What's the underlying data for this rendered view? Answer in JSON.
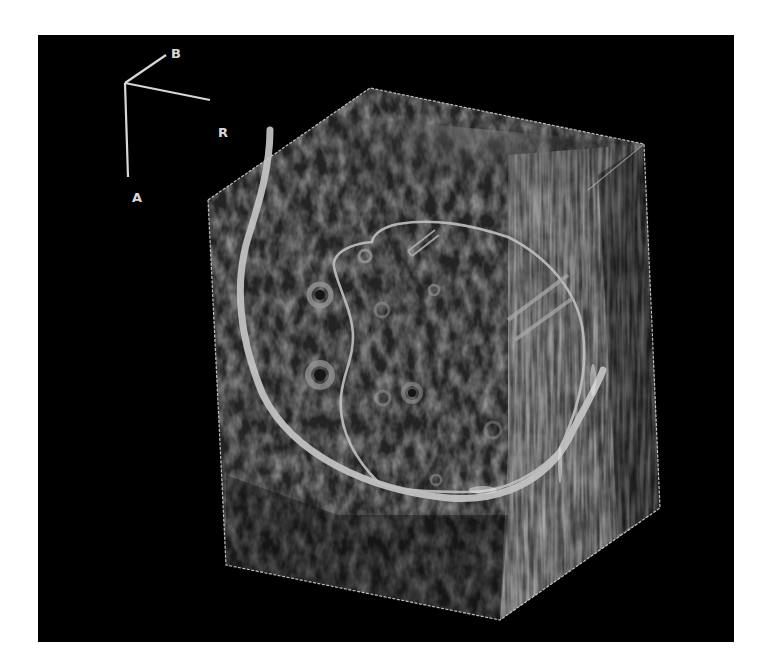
{
  "figure": {
    "type": "3D ultrasound volume rendering",
    "background_color": "#000000",
    "page_color": "#ffffff"
  },
  "orientation_axes": {
    "labels": [
      {
        "id": "B",
        "text": "B"
      },
      {
        "id": "R",
        "text": "R"
      },
      {
        "id": "A",
        "text": "A"
      }
    ],
    "color": "#d8d8d8"
  },
  "volume": {
    "bounding_box_color": "#cfcfcf",
    "structures": [
      {
        "name": "outer-contour",
        "style": "thick bright curve",
        "color": "#c8c8c8"
      },
      {
        "name": "inner-contour",
        "style": "thin bright D-shaped outline",
        "color": "#bdbdbd"
      },
      {
        "name": "needle-tract",
        "style": "short double line"
      },
      {
        "name": "parallel-lines",
        "style": "two diagonal bands on right"
      },
      {
        "name": "follicles",
        "style": "ring-shaped hypoechoic spots",
        "count": 9
      }
    ]
  }
}
